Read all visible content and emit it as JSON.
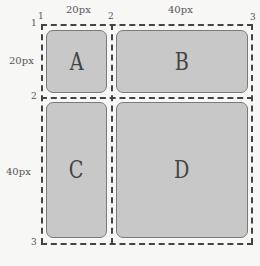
{
  "diagram": {
    "column_sizes": [
      "20px",
      "40px"
    ],
    "row_sizes": [
      "20px",
      "40px"
    ],
    "column_line_numbers": [
      "1",
      "2",
      "3"
    ],
    "row_line_numbers": [
      "1",
      "2",
      "3"
    ],
    "cells": [
      {
        "label": "A"
      },
      {
        "label": "B"
      },
      {
        "label": "C"
      },
      {
        "label": "D"
      }
    ],
    "colors": {
      "cell_fill": "#c8c8c8",
      "cell_border": "#7a7a7a",
      "grid_line": "#444444",
      "background": "#f7f7f5"
    }
  }
}
